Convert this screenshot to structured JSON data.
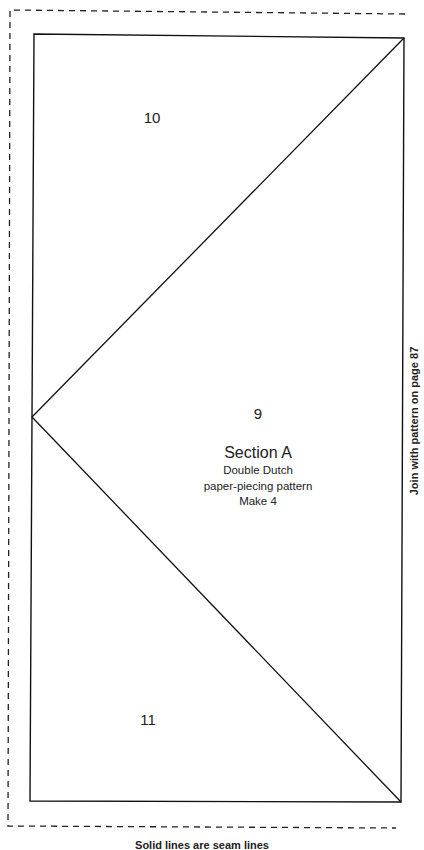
{
  "pattern": {
    "pieces": [
      {
        "number": "10",
        "x": 152,
        "y": 117
      },
      {
        "number": "9",
        "x": 258,
        "y": 413
      },
      {
        "number": "11",
        "x": 148,
        "y": 719
      }
    ],
    "section": {
      "title": "Section A",
      "lines": [
        "Double Dutch",
        "paper-piecing pattern",
        "Make 4"
      ]
    },
    "side_note": "Join with pattern on page 87",
    "footer": "Solid lines are seam lines",
    "colors": {
      "line": "#111111",
      "background": "#ffffff"
    }
  }
}
